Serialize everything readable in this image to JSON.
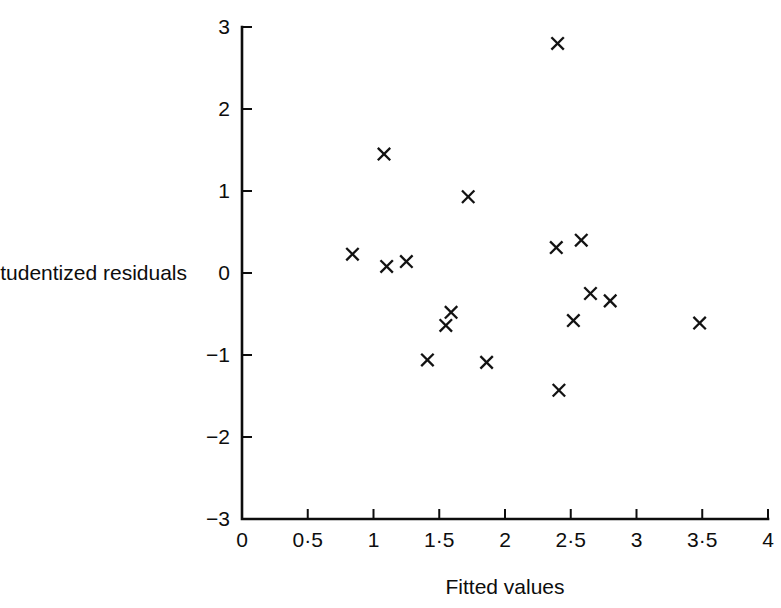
{
  "chart_data": {
    "type": "scatter",
    "title": "",
    "xlabel": "Fitted values",
    "ylabel": "Studentized residuals",
    "xlim": [
      0,
      4
    ],
    "ylim": [
      -3,
      3
    ],
    "grid": false,
    "legend": null,
    "marker": "x",
    "marker_color": "#121212",
    "xticks": [
      0,
      0.5,
      1,
      1.5,
      2,
      2.5,
      3,
      3.5,
      4
    ],
    "xtick_labels": [
      "0",
      "0·5",
      "1",
      "1·5",
      "2",
      "2·5",
      "3",
      "3·5",
      "4"
    ],
    "yticks": [
      -3,
      -2,
      -1,
      0,
      1,
      2,
      3
    ],
    "ytick_labels": [
      "−3",
      "−2",
      "−1",
      "0",
      "1",
      "2",
      "3"
    ],
    "points": [
      {
        "x": 0.84,
        "y": 0.23
      },
      {
        "x": 1.08,
        "y": 1.45
      },
      {
        "x": 1.1,
        "y": 0.08
      },
      {
        "x": 1.25,
        "y": 0.14
      },
      {
        "x": 1.41,
        "y": -1.06
      },
      {
        "x": 1.59,
        "y": -0.48
      },
      {
        "x": 1.55,
        "y": -0.64
      },
      {
        "x": 1.72,
        "y": 0.93
      },
      {
        "x": 1.86,
        "y": -1.09
      },
      {
        "x": 2.4,
        "y": 2.8
      },
      {
        "x": 2.39,
        "y": 0.31
      },
      {
        "x": 2.41,
        "y": -1.43
      },
      {
        "x": 2.58,
        "y": 0.4
      },
      {
        "x": 2.65,
        "y": -0.25
      },
      {
        "x": 2.52,
        "y": -0.58
      },
      {
        "x": 2.8,
        "y": -0.34
      },
      {
        "x": 3.48,
        "y": -0.61
      }
    ]
  },
  "axes": {
    "x_axis_name": "Fitted values",
    "y_axis_name": "Studentized residuals"
  }
}
